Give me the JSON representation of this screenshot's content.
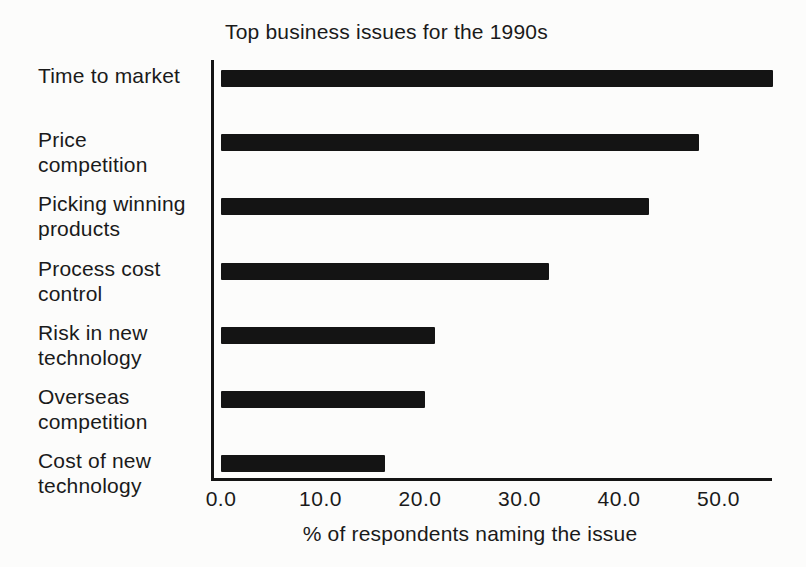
{
  "chart_data": {
    "type": "bar",
    "orientation": "horizontal",
    "title": "Top business issues for the 1990s",
    "xlabel": "% of respondents naming the issue",
    "ylabel": "",
    "categories": [
      "Time to market",
      "Price competition",
      "Picking winning products",
      "Process cost control",
      "Risk in new technology",
      "Overseas competition",
      "Cost of new technology"
    ],
    "category_lines": [
      [
        "Time to market"
      ],
      [
        "Price",
        "competition"
      ],
      [
        "Picking winning",
        "products"
      ],
      [
        "Process cost",
        "control"
      ],
      [
        "Risk in new",
        "technology"
      ],
      [
        "Overseas",
        "competition"
      ],
      [
        "Cost of new",
        "technology"
      ]
    ],
    "values": [
      55.5,
      48.0,
      43.0,
      33.0,
      21.5,
      20.5,
      16.5
    ],
    "x_ticks": [
      "0.0",
      "10.0",
      "20.0",
      "30.0",
      "40.0",
      "50.0"
    ],
    "x_tick_values": [
      0,
      10,
      20,
      30,
      40,
      50
    ],
    "xlim": [
      0,
      55.5
    ],
    "grid": false,
    "legend": "none",
    "bar_color": "#141414",
    "background_color": "#fcfcfb",
    "text_color": "#1a1a1a"
  }
}
